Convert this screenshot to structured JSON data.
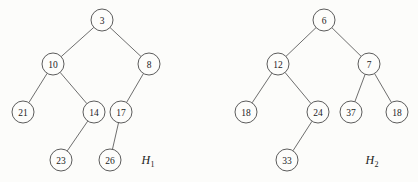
{
  "figure": {
    "background_color": "#fcfcfa",
    "node_fill_color": "#fdfdfb",
    "node_stroke_color": "#4a4a4a",
    "edge_color": "#5d5d5d",
    "text_color": "#1b1b1b",
    "node_radius": 11
  },
  "trees": [
    {
      "id": "H1",
      "name_base": "H",
      "name_subscript": "1",
      "label_x": 148,
      "label_y": 160,
      "nodes": [
        {
          "id": "h1-3",
          "value": "3",
          "cx": 102,
          "cy": 20
        },
        {
          "id": "h1-10",
          "value": "10",
          "cx": 53,
          "cy": 64
        },
        {
          "id": "h1-8",
          "value": "8",
          "cx": 149,
          "cy": 64
        },
        {
          "id": "h1-21",
          "value": "21",
          "cx": 23,
          "cy": 112
        },
        {
          "id": "h1-14",
          "value": "14",
          "cx": 94,
          "cy": 112
        },
        {
          "id": "h1-17",
          "value": "17",
          "cx": 121,
          "cy": 112
        },
        {
          "id": "h1-23",
          "value": "23",
          "cx": 61,
          "cy": 160
        },
        {
          "id": "h1-26",
          "value": "26",
          "cx": 110,
          "cy": 160
        }
      ],
      "edges": [
        {
          "from": "h1-3",
          "to": "h1-10"
        },
        {
          "from": "h1-3",
          "to": "h1-8"
        },
        {
          "from": "h1-10",
          "to": "h1-21"
        },
        {
          "from": "h1-10",
          "to": "h1-14"
        },
        {
          "from": "h1-8",
          "to": "h1-17"
        },
        {
          "from": "h1-14",
          "to": "h1-23"
        },
        {
          "from": "h1-17",
          "to": "h1-26"
        }
      ]
    },
    {
      "id": "H2",
      "name_base": "H",
      "name_subscript": "2",
      "label_x": 372,
      "label_y": 160,
      "nodes": [
        {
          "id": "h2-6",
          "value": "6",
          "cx": 324,
          "cy": 20
        },
        {
          "id": "h2-12",
          "value": "12",
          "cx": 278,
          "cy": 64
        },
        {
          "id": "h2-7",
          "value": "7",
          "cx": 369,
          "cy": 64
        },
        {
          "id": "h2-18",
          "value": "18",
          "cx": 246,
          "cy": 112
        },
        {
          "id": "h2-24",
          "value": "24",
          "cx": 318,
          "cy": 112
        },
        {
          "id": "h2-37",
          "value": "37",
          "cx": 351,
          "cy": 112
        },
        {
          "id": "h2-18b",
          "value": "18",
          "cx": 397,
          "cy": 112
        },
        {
          "id": "h2-33",
          "value": "33",
          "cx": 287,
          "cy": 160
        }
      ],
      "edges": [
        {
          "from": "h2-6",
          "to": "h2-12"
        },
        {
          "from": "h2-6",
          "to": "h2-7"
        },
        {
          "from": "h2-12",
          "to": "h2-18"
        },
        {
          "from": "h2-12",
          "to": "h2-24"
        },
        {
          "from": "h2-7",
          "to": "h2-37"
        },
        {
          "from": "h2-7",
          "to": "h2-18b"
        },
        {
          "from": "h2-24",
          "to": "h2-33"
        }
      ]
    }
  ]
}
